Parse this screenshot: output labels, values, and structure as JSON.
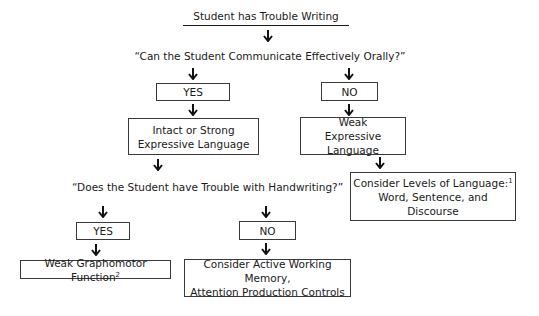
{
  "title": "Student has Trouble Writing",
  "question1": "“Can the Student Communicate Effectively Orally?”",
  "q1_yes": "YES",
  "q1_no": "NO",
  "intact": {
    "line1": "Intact or Strong",
    "line2": "Expressive Language"
  },
  "weak": {
    "line1": "Weak",
    "line2": "Expressive Language"
  },
  "levels": {
    "line1": "Consider Levels of Language:",
    "sup": "1",
    "line2": "Word, Sentence, and Discourse"
  },
  "question2": "“Does the Student have Trouble with Handwriting?”",
  "q2_yes": "YES",
  "q2_no": "NO",
  "grapho": {
    "text": "Weak Graphomotor Function",
    "sup": "2"
  },
  "active": {
    "line1": "Consider Active Working Memory,",
    "line2": "Attention Production Controls"
  },
  "icons": {
    "arrow": "down-arrow-icon"
  }
}
